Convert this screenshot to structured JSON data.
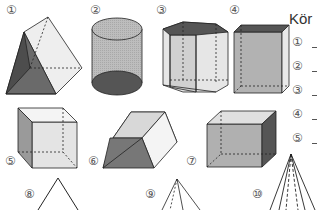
{
  "worksheet": {
    "title": "Kör",
    "shapes": [
      {
        "number": "①",
        "name": "triangular-prism"
      },
      {
        "number": "②",
        "name": "cylinder"
      },
      {
        "number": "③",
        "name": "hexagonal-prism"
      },
      {
        "number": "④",
        "name": "cuboid-tall"
      },
      {
        "number": "⑤",
        "name": "cube"
      },
      {
        "number": "⑥",
        "name": "trapezoidal-prism"
      },
      {
        "number": "⑦",
        "name": "cuboid-wide"
      },
      {
        "number": "⑧",
        "name": "cone-partial"
      },
      {
        "number": "⑨",
        "name": "pyramid-partial"
      },
      {
        "number": "⑩",
        "name": "pyramid-tall-partial"
      }
    ],
    "answers": [
      {
        "number": "①",
        "value": ""
      },
      {
        "number": "②",
        "value": ""
      },
      {
        "number": "③",
        "value": ""
      },
      {
        "number": "④",
        "value": ""
      },
      {
        "number": "⑤",
        "value": ""
      }
    ]
  },
  "colors": {
    "dark_face": "#555555",
    "mid_face": "#9a9a9a",
    "light_face": "#d4d4d4",
    "pale_face": "#eeeeee",
    "stroke": "#222222"
  }
}
